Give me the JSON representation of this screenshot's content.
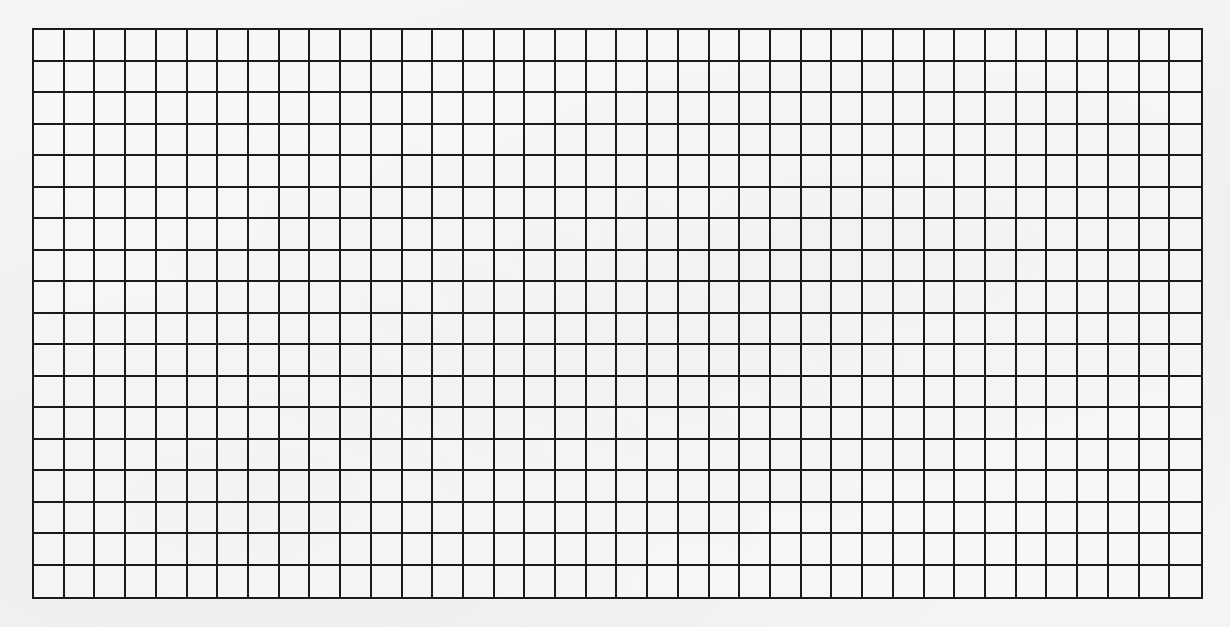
{
  "grid": {
    "columns": 38,
    "rows": 18,
    "line_color": "#1a1a1a",
    "background_color": "#f4f4f2"
  }
}
